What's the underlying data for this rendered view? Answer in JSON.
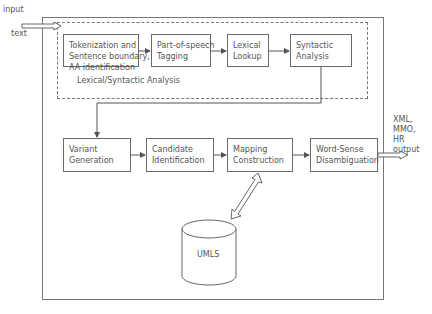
{
  "input_label": {
    "line1": "input",
    "line2": "text"
  },
  "group_label": "Lexical/Syntactic Analysis",
  "lexical_steps": [
    {
      "label": "Tokenization and\nSentence boundary,\nAA identification"
    },
    {
      "label": "Part-of-speech\nTagging"
    },
    {
      "label": "Lexical\nLookup"
    },
    {
      "label": "Syntactic\nAnalysis"
    }
  ],
  "mapping_steps": [
    {
      "label": "Variant\nGeneration"
    },
    {
      "label": "Candidate\nIdentification"
    },
    {
      "label": "Mapping\nConstruction"
    },
    {
      "label": "Word-Sense\nDisambiguation"
    }
  ],
  "database": {
    "label": "UMLS"
  },
  "output_label": {
    "line1": "XML,",
    "line2": "MMO,",
    "line3": "HR",
    "line4": "output"
  }
}
